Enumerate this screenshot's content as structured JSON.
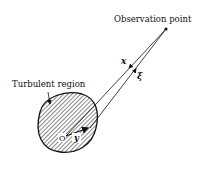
{
  "diagram": {
    "labels": {
      "observation_point": "Observation point",
      "turbulent_region": "Turbulent region",
      "origin": "O",
      "vector_x": "x",
      "vector_xi": "ξ",
      "vector_y": "y"
    },
    "colors": {
      "ink": "#111111",
      "background": "#ffffff"
    }
  }
}
